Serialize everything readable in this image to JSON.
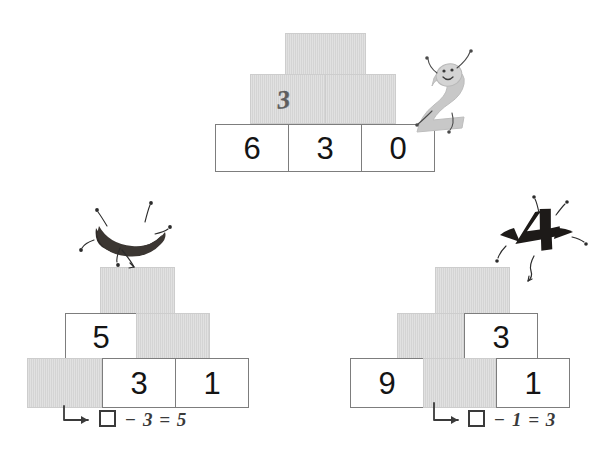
{
  "page": {
    "background_color": "#ffffff",
    "block_gray": "#d4d4d4",
    "block_white": "#ffffff",
    "ink_color": "#141414",
    "pencil_color": "#4d4d4d"
  },
  "puzzles": [
    {
      "id": "top",
      "name": "pyramid-top",
      "mascot": {
        "name": "digit-two-mascot",
        "glyph": "2",
        "color": "#c9c9c9",
        "style": "light-gray-smiling-character"
      },
      "rows": [
        {
          "cells": [
            {
              "fill": "gray",
              "value": ""
            }
          ]
        },
        {
          "cells": [
            {
              "fill": "gray",
              "value": "3",
              "handwritten": true
            },
            {
              "fill": "gray",
              "value": ""
            }
          ]
        },
        {
          "cells": [
            {
              "fill": "white",
              "value": "6"
            },
            {
              "fill": "white",
              "value": "3"
            },
            {
              "fill": "white",
              "value": "0"
            }
          ]
        }
      ],
      "equation": ""
    },
    {
      "id": "bottom-left",
      "name": "pyramid-bottom-left",
      "mascot": {
        "name": "dark-crescent-mascot",
        "glyph": "",
        "color": "#2e2a27",
        "style": "dark-curved-character"
      },
      "rows": [
        {
          "cells": [
            {
              "fill": "gray",
              "value": ""
            }
          ]
        },
        {
          "cells": [
            {
              "fill": "white",
              "value": "5"
            },
            {
              "fill": "gray",
              "value": ""
            }
          ]
        },
        {
          "cells": [
            {
              "fill": "gray",
              "value": ""
            },
            {
              "fill": "white",
              "value": "3"
            },
            {
              "fill": "white",
              "value": "1"
            }
          ]
        }
      ],
      "equation": {
        "box": "□",
        "operator": "−",
        "operand": "3",
        "equals": "=",
        "result": "5",
        "text": "□ − 3 = 5"
      }
    },
    {
      "id": "bottom-right",
      "name": "pyramid-bottom-right",
      "mascot": {
        "name": "dark-four-mascot",
        "glyph": "4",
        "color": "#1d1a18",
        "style": "dark-digit-four-character"
      },
      "rows": [
        {
          "cells": [
            {
              "fill": "gray",
              "value": ""
            }
          ]
        },
        {
          "cells": [
            {
              "fill": "gray",
              "value": ""
            },
            {
              "fill": "white",
              "value": "3"
            }
          ]
        },
        {
          "cells": [
            {
              "fill": "white",
              "value": "9"
            },
            {
              "fill": "gray",
              "value": ""
            },
            {
              "fill": "white",
              "value": "1"
            }
          ]
        }
      ],
      "equation": {
        "box": "□",
        "operator": "−",
        "operand": "1",
        "equals": "=",
        "result": "3",
        "text": "□ − 1 = 3"
      }
    }
  ]
}
